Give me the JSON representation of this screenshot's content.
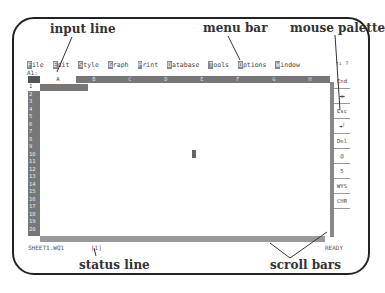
{
  "callouts": {
    "input_line": "input line",
    "menu_bar": "menu bar",
    "mouse_palette": "mouse palette",
    "work_area": "work area",
    "status_line": "status line",
    "scroll_bars": "scroll bars"
  },
  "menubar": {
    "items": [
      {
        "hotkey": "F",
        "rest": "ile"
      },
      {
        "hotkey": "E",
        "rest": "dit"
      },
      {
        "hotkey": "S",
        "rest": "tyle"
      },
      {
        "hotkey": "G",
        "rest": "raph"
      },
      {
        "hotkey": "P",
        "rest": "rint"
      },
      {
        "hotkey": "D",
        "rest": "atabase"
      },
      {
        "hotkey": "T",
        "rest": "ools"
      },
      {
        "hotkey": "O",
        "rest": "ptions"
      },
      {
        "hotkey": "W",
        "rest": "indow"
      }
    ]
  },
  "input_line": {
    "cell_ref": "A1:"
  },
  "columns": [
    "A",
    "B",
    "C",
    "D",
    "E",
    "F",
    "G",
    "H"
  ],
  "rows": [
    "1",
    "2",
    "3",
    "4",
    "5",
    "6",
    "7",
    "8",
    "9",
    "10",
    "11",
    "12",
    "13",
    "14",
    "15",
    "16",
    "17",
    "18",
    "19",
    "20"
  ],
  "palette": {
    "top": "↑↓ ?",
    "items": [
      "End",
      "◄►",
      "Esc",
      "◄┘",
      "Del",
      "@",
      "5",
      "WYS",
      "CHR"
    ]
  },
  "status": {
    "file": "SHEET1.WQ1",
    "window": "[1]",
    "mode": "READY"
  }
}
